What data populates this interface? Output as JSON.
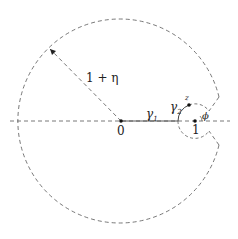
{
  "diagram": {
    "type": "contour-in-complex-plane",
    "colors": {
      "stroke": "#555555",
      "solid": "#444444",
      "point": "#111111",
      "text": "#222222"
    },
    "geometry": {
      "origin": [
        121,
        121
      ],
      "big_radius": 102,
      "point_one": [
        195,
        121
      ],
      "small_radius": 17,
      "phi_deg": 35
    },
    "labels": {
      "origin": "0",
      "one": "1",
      "radius": "1 + η",
      "gamma1": "γ",
      "gamma1_sub": "1",
      "gamma2": "γ",
      "gamma2_sub": "2",
      "z": "z",
      "phi": "ϕ"
    }
  }
}
